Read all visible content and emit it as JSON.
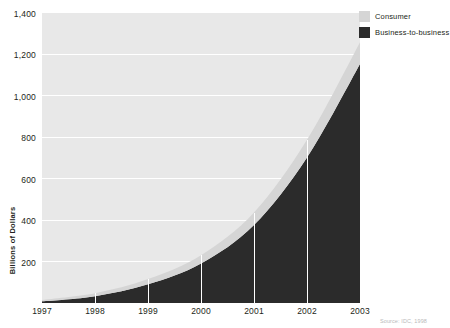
{
  "chart_data": {
    "type": "area",
    "stacked": true,
    "title": "",
    "subtitle": "",
    "xlabel": "",
    "ylabel": "Billions of Dollars",
    "x": [
      1997,
      1998,
      1999,
      2000,
      2001,
      2002,
      2003
    ],
    "categories": [
      "1997",
      "1998",
      "1999",
      "2000",
      "2001",
      "2002",
      "2003"
    ],
    "xtick_labels": [
      "1997",
      "1998",
      "1999",
      "2000",
      "2001",
      "2002",
      "2003"
    ],
    "ytick_labels": [
      "200",
      "400",
      "600",
      "800",
      "1,000",
      "1,200",
      "1,400"
    ],
    "ytick_values": [
      200,
      400,
      600,
      800,
      1000,
      1200,
      1400
    ],
    "ylim": [
      0,
      1400
    ],
    "xlim": [
      1997,
      2003
    ],
    "grid": true,
    "grid_axis": "y",
    "legend_position": "top-right",
    "series": [
      {
        "name": "Business-to-business",
        "color": "#2b2b2b",
        "values": [
          8,
          33,
          90,
          190,
          375,
          700,
          1150
        ]
      },
      {
        "name": "Consumer",
        "color": "#d5d5d5",
        "values": [
          7,
          14,
          25,
          40,
          60,
          85,
          105
        ]
      }
    ],
    "totals": [
      15,
      47,
      115,
      230,
      435,
      785,
      1255
    ],
    "annotations": [],
    "source": "Source: IDC, 1998"
  },
  "axes": {
    "y_title": "Billions of Dollars",
    "y_ticks": [
      {
        "label": "1,400",
        "value": 1400
      },
      {
        "label": "1,200",
        "value": 1200
      },
      {
        "label": "1,000",
        "value": 1000
      },
      {
        "label": "800",
        "value": 800
      },
      {
        "label": "600",
        "value": 600
      },
      {
        "label": "400",
        "value": 400
      },
      {
        "label": "200",
        "value": 200
      }
    ],
    "x_ticks": [
      {
        "label": "1997"
      },
      {
        "label": "1998"
      },
      {
        "label": "1999"
      },
      {
        "label": "2000"
      },
      {
        "label": "2001"
      },
      {
        "label": "2002"
      },
      {
        "label": "2003"
      }
    ]
  },
  "legend": {
    "items": [
      {
        "label": "Consumer",
        "color": "#d5d5d5"
      },
      {
        "label": "Business-to-business",
        "color": "#2b2b2b"
      }
    ]
  },
  "footer": {
    "source": "Source: IDC, 1998"
  },
  "colors": {
    "plot_background": "#e8e8e8",
    "gridline": "#ffffff",
    "consumer": "#d5d5d5",
    "business": "#2b2b2b",
    "text": "#231f20",
    "page_background": "#ffffff"
  }
}
